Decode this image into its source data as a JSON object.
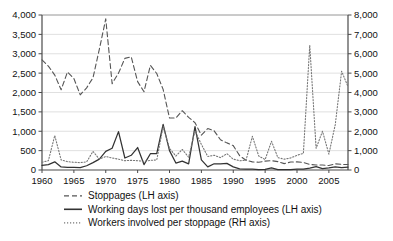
{
  "chart_data": {
    "type": "line",
    "title": "",
    "subtitle": "",
    "xlabel": "",
    "ylabel": "",
    "y2label": "",
    "grid": true,
    "legend_position": "bottom",
    "x": [
      1960,
      1961,
      1962,
      1963,
      1964,
      1965,
      1966,
      1967,
      1968,
      1969,
      1970,
      1971,
      1972,
      1973,
      1974,
      1975,
      1976,
      1977,
      1978,
      1979,
      1980,
      1981,
      1982,
      1983,
      1984,
      1985,
      1986,
      1987,
      1988,
      1989,
      1990,
      1991,
      1992,
      1993,
      1994,
      1995,
      1996,
      1997,
      1998,
      1999,
      2000,
      2001,
      2002,
      2003,
      2004,
      2005,
      2006,
      2007,
      2008
    ],
    "xlim": [
      1960,
      2008
    ],
    "ylim": [
      0,
      4000
    ],
    "y2lim": [
      0,
      8000
    ],
    "xticks": [
      1960,
      1965,
      1970,
      1975,
      1980,
      1985,
      1990,
      1995,
      2000,
      2005
    ],
    "xtick_labels": [
      "1960",
      "1965",
      "1970",
      "1975",
      "1980",
      "1985",
      "1990",
      "1995",
      "2000",
      "2005"
    ],
    "yticks": [
      0,
      500,
      1000,
      1500,
      2000,
      2500,
      3000,
      3500,
      4000
    ],
    "ytick_labels": [
      "0",
      "500",
      "1,000",
      "1,500",
      "2,000",
      "2,500",
      "3,000",
      "3,500",
      "4,000"
    ],
    "y2ticks": [
      0,
      1000,
      2000,
      3000,
      4000,
      5000,
      6000,
      7000,
      8000
    ],
    "y2tick_labels": [
      "0",
      "1,000",
      "2,000",
      "3,000",
      "4,000",
      "5,000",
      "6,000",
      "7,000",
      "8,000"
    ],
    "series": [
      {
        "name": "Stoppages (LH axis)",
        "axis": "left",
        "style": "dashed",
        "color": "#555555",
        "values": [
          2840,
          2680,
          2450,
          2070,
          2530,
          2360,
          1940,
          2120,
          2380,
          3120,
          3900,
          2230,
          2500,
          2880,
          2920,
          2280,
          2020,
          2700,
          2490,
          2080,
          1340,
          1340,
          1530,
          1360,
          1220,
          900,
          1070,
          1010,
          780,
          700,
          630,
          370,
          250,
          210,
          200,
          230,
          240,
          215,
          165,
          205,
          210,
          195,
          145,
          130,
          130,
          115,
          160,
          145,
          140
        ]
      },
      {
        "name": "Working days lost per thousand employees (LH axis)",
        "axis": "left",
        "style": "solid",
        "color": "#333333",
        "values": [
          120,
          140,
          210,
          80,
          70,
          70,
          60,
          110,
          190,
          280,
          480,
          560,
          990,
          310,
          380,
          580,
          140,
          420,
          420,
          1180,
          500,
          180,
          230,
          160,
          1120,
          260,
          80,
          160,
          160,
          170,
          80,
          30,
          20,
          25,
          12,
          18,
          55,
          12,
          10,
          12,
          20,
          20,
          50,
          85,
          35,
          55,
          80,
          60,
          75
        ]
      },
      {
        "name": "Workers involved per stoppage (RH axis)",
        "axis": "right",
        "style": "dotted",
        "color": "#777777",
        "values": [
          400,
          480,
          1780,
          520,
          430,
          400,
          380,
          420,
          960,
          560,
          700,
          620,
          560,
          480,
          500,
          480,
          440,
          500,
          520,
          2240,
          1120,
          720,
          1060,
          660,
          2020,
          1320,
          700,
          760,
          640,
          840,
          560,
          480,
          500,
          1740,
          720,
          540,
          1480,
          640,
          560,
          620,
          760,
          860,
          6440,
          1120,
          2000,
          820,
          2340,
          5100,
          4300
        ]
      }
    ]
  },
  "legend": {
    "items": [
      {
        "label": "Stoppages (LH axis)",
        "style": "dashed"
      },
      {
        "label": "Working days lost per thousand employees (LH axis)",
        "style": "solid"
      },
      {
        "label": "Workers involved per stoppage (RH axis)",
        "style": "dotted"
      }
    ]
  }
}
